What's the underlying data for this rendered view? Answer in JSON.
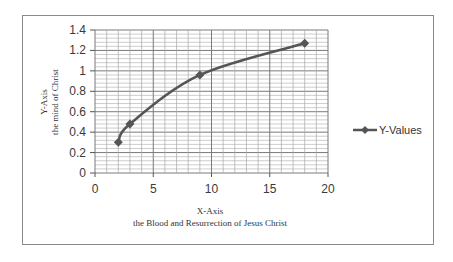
{
  "chart_data": {
    "type": "line",
    "title": "",
    "xlabel": "X-Axis",
    "xlabel_sub": "the Blood and Resurrection of Jesus Christ",
    "ylabel": "Y-Axis",
    "ylabel_sub": "the mind of Christ",
    "xlim": [
      0,
      20
    ],
    "ylim": [
      0,
      1.4
    ],
    "x_ticks": [
      "0",
      "5",
      "10",
      "15",
      "20"
    ],
    "y_ticks": [
      "0",
      "0.2",
      "0.4",
      "0.6",
      "0.8",
      "1",
      "1.2",
      "1.4"
    ],
    "grid": true,
    "legend_position": "right",
    "series": [
      {
        "name": "Y-Values",
        "color": "#555555",
        "marker": "diamond",
        "smooth": true,
        "x": [
          2,
          3,
          9,
          18
        ],
        "y": [
          0.3,
          0.48,
          0.96,
          1.27
        ]
      }
    ]
  }
}
